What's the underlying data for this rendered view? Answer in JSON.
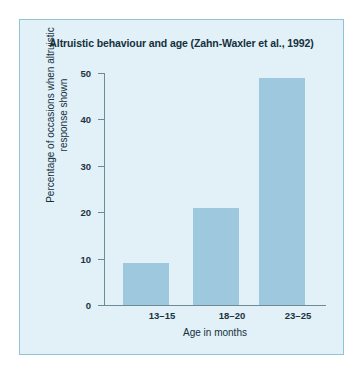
{
  "chart_data": {
    "type": "bar",
    "title": "Altruistic behaviour and age (Zahn-Waxler et al., 1992)",
    "categories": [
      "13–15",
      "18–20",
      "23–25"
    ],
    "values": [
      9,
      21,
      49
    ],
    "xlabel": "Age in months",
    "ylabel": "Percentage of occasions when altruistic response shown",
    "ylabel_line1": "Percentage of occasions when altruistic",
    "ylabel_line2": "response shown",
    "ylim": [
      0,
      50
    ],
    "yticks": [
      0,
      10,
      20,
      30,
      40,
      50
    ],
    "ytick_labels": [
      "0",
      "10",
      "20",
      "30",
      "40",
      "50"
    ],
    "grid": false,
    "legend": false,
    "colors": {
      "bar_fill": "#9ec8de",
      "panel_background": "#e2f0f8",
      "panel_border": "#8fc4d6",
      "axis_line": "#6d8a96",
      "text": "#14303c"
    }
  }
}
